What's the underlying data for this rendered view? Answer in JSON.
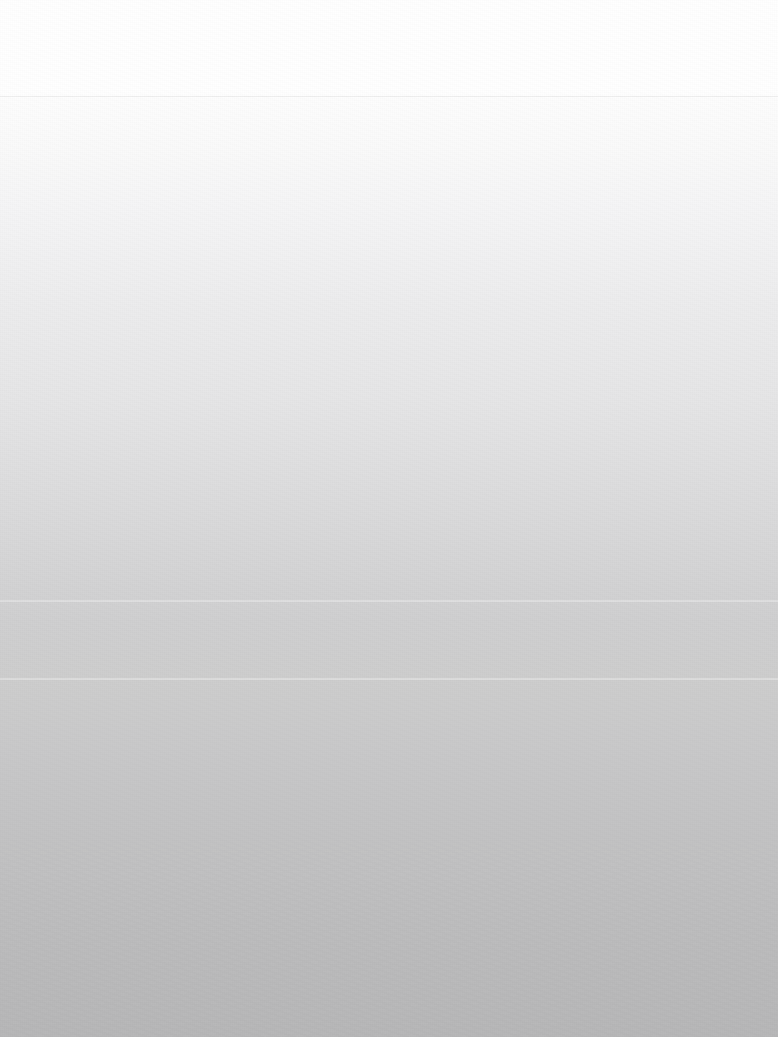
{
  "screen": {
    "width": 778,
    "height": 1037,
    "description": "blank-screen",
    "state": "empty",
    "visible_text": "",
    "colors": {
      "top": "#ffffff",
      "upper_mid": "#ededee",
      "mid": "#dcdcdd",
      "lower_mid": "#c9c9ca",
      "bottom": "#b7b7b8",
      "divider": "rgba(0,0,0,0.055)",
      "faint_band": "rgba(255,255,255,0.30)"
    }
  },
  "header": {
    "title": "",
    "divider_y": 96
  },
  "content": {
    "items": [],
    "message": ""
  },
  "bands": [
    {
      "name": "faint-band-upper",
      "y": 600
    },
    {
      "name": "faint-band-lower",
      "y": 678
    }
  ]
}
